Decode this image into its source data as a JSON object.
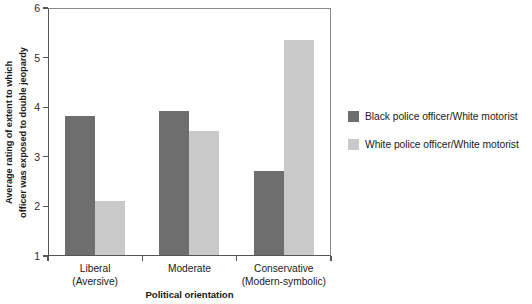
{
  "chart_data": {
    "type": "bar",
    "title": "",
    "xlabel": "Political orientation",
    "ylabel_lines": [
      "Average rating of extent to which",
      "officer was exposed to double jeopardy"
    ],
    "ylabel": "Average rating of extent to which officer was exposed to double jeopardy",
    "categories": [
      "Liberal (Aversive)",
      "Moderate",
      "Conservative (Modern-symbolic)"
    ],
    "category_lines": [
      [
        "Liberal",
        "(Aversive)"
      ],
      [
        "Moderate",
        ""
      ],
      [
        "Conservative",
        "(Modern-symbolic)"
      ]
    ],
    "series": [
      {
        "name": "Black police officer/White motorist",
        "color": "#6e6e6e",
        "values": [
          3.83,
          3.93,
          2.72
        ]
      },
      {
        "name": "White police officer/White motorist",
        "color": "#c9c9c9",
        "values": [
          2.12,
          3.53,
          5.35
        ]
      }
    ],
    "ylim": [
      1,
      6
    ],
    "yticks": [
      1,
      2,
      3,
      4,
      5,
      6
    ],
    "ytick_labels": [
      "1",
      "2",
      "3",
      "4",
      "5",
      "6"
    ],
    "grid": false,
    "legend_position": "right"
  },
  "legend": {
    "entries": [
      {
        "label": "Black police officer/White motorist"
      },
      {
        "label": "White police officer/White motorist"
      }
    ]
  },
  "colors": {
    "series_dark": "#6e6e6e",
    "series_light": "#c9c9c9",
    "axis": "#555555",
    "frame": "#8a8a8a",
    "text": "#1a1a1a",
    "background": "#ffffff"
  }
}
